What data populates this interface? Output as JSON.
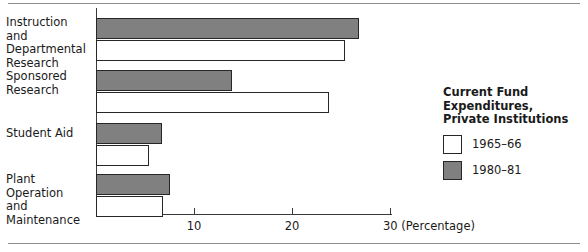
{
  "chart_data": {
    "type": "bar",
    "orientation": "horizontal",
    "title": "",
    "xlabel": "(Percentage)",
    "ylabel": "",
    "categories": [
      "Instruction and Departmental Research",
      "Sponsored Research",
      "Student Aid",
      "Plant Operation and Maintenance"
    ],
    "series": [
      {
        "name": "1965–66",
        "values": [
          25.4,
          23.8,
          5.4,
          6.8
        ]
      },
      {
        "name": "1980–81",
        "values": [
          26.8,
          13.9,
          6.7,
          7.5
        ]
      }
    ],
    "xlim": [
      0,
      30.2
    ],
    "xticks": [
      10,
      20,
      30
    ],
    "xtick_labels": [
      "10",
      "20",
      "30 (Percentage)"
    ],
    "grid": false,
    "legend_position": "right"
  },
  "axis": {
    "ticks": [
      {
        "value": 10,
        "label": "10"
      },
      {
        "value": 20,
        "label": "20"
      },
      {
        "value": 30,
        "label": "30 (Percentage)"
      }
    ]
  },
  "categories": [
    {
      "lines": [
        "Instruction and",
        "Departmental",
        "Research"
      ]
    },
    {
      "lines": [
        "Sponsored",
        "Research"
      ]
    },
    {
      "lines": [
        "Student Aid"
      ]
    },
    {
      "lines": [
        "Plant Operation",
        "and Maintenance"
      ]
    }
  ],
  "legend": {
    "title_lines": [
      "Current Fund Expenditures,",
      "Private Institutions"
    ],
    "entries": [
      {
        "label": "1965–66",
        "swatch": "white"
      },
      {
        "label": "1980–81",
        "swatch": "gray"
      }
    ]
  },
  "colors": {
    "bar_old": "#ffffff",
    "bar_new": "#808080",
    "bar_outline": "#262626",
    "axis": "#3a3a3a",
    "rule": "#8c8c8c",
    "text": "#1a1a1a"
  }
}
